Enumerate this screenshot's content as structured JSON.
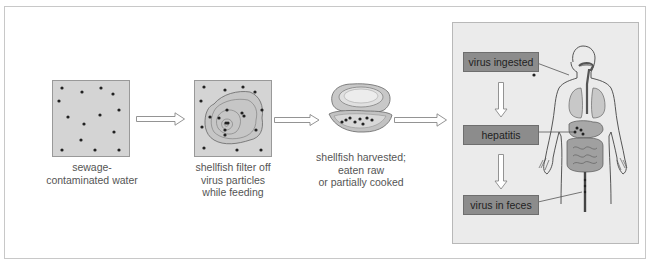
{
  "diagram": {
    "title": "",
    "colors": {
      "water_fill": "#d4d4d4",
      "panel_fill": "#ebebeb",
      "label_box_fill": "#8c8c8c",
      "frame_border": "#c8c8c8",
      "caption_text": "#555555"
    },
    "steps": [
      {
        "id": "water",
        "caption_lines": [
          "sewage-",
          "contaminated water"
        ],
        "icon": "water-with-virus-dots"
      },
      {
        "id": "filter",
        "caption_lines": [
          "shellfish filter off",
          "virus particles",
          "while feeding"
        ],
        "icon": "oyster-in-water"
      },
      {
        "id": "harvest",
        "caption_lines": [
          "shellfish harvested;",
          "eaten raw",
          "or partially cooked"
        ],
        "icon": "open-oyster"
      }
    ],
    "body_panel": {
      "labels": [
        {
          "id": "ingested",
          "text": "virus ingested"
        },
        {
          "id": "hepatitis",
          "text": "hepatitis"
        },
        {
          "id": "feces",
          "text": "virus in feces"
        }
      ],
      "figure": "human-digestive-system"
    },
    "arrows": [
      "water-to-filter",
      "filter-to-harvest",
      "harvest-to-body",
      "ingested-to-hepatitis",
      "hepatitis-to-feces"
    ]
  }
}
